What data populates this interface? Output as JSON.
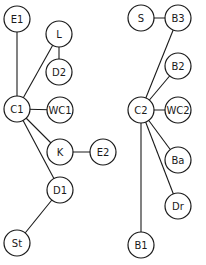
{
  "diagram": {
    "type": "graph",
    "node_radius": 13,
    "nodes": [
      {
        "id": "E1",
        "label": "E1",
        "x": 17,
        "y": 19
      },
      {
        "id": "L",
        "label": "L",
        "x": 59,
        "y": 34
      },
      {
        "id": "D2",
        "label": "D2",
        "x": 59,
        "y": 72
      },
      {
        "id": "C1",
        "label": "C1",
        "x": 17,
        "y": 109
      },
      {
        "id": "WC1",
        "label": "WC1",
        "x": 60,
        "y": 110
      },
      {
        "id": "K",
        "label": "K",
        "x": 60,
        "y": 152
      },
      {
        "id": "E2",
        "label": "E2",
        "x": 103,
        "y": 152
      },
      {
        "id": "D1",
        "label": "D1",
        "x": 60,
        "y": 190
      },
      {
        "id": "St",
        "label": "St",
        "x": 17,
        "y": 243
      },
      {
        "id": "S",
        "label": "S",
        "x": 141,
        "y": 18
      },
      {
        "id": "B3",
        "label": "B3",
        "x": 178,
        "y": 18
      },
      {
        "id": "B2",
        "label": "B2",
        "x": 178,
        "y": 66
      },
      {
        "id": "C2",
        "label": "C2",
        "x": 141,
        "y": 110
      },
      {
        "id": "WC2",
        "label": "WC2",
        "x": 178,
        "y": 110
      },
      {
        "id": "Ba",
        "label": "Ba",
        "x": 178,
        "y": 160
      },
      {
        "id": "Dr",
        "label": "Dr",
        "x": 178,
        "y": 206
      },
      {
        "id": "B1",
        "label": "B1",
        "x": 141,
        "y": 245
      }
    ],
    "edges": [
      [
        "C1",
        "E1"
      ],
      [
        "C1",
        "L"
      ],
      [
        "L",
        "D2"
      ],
      [
        "C1",
        "WC1"
      ],
      [
        "C1",
        "K"
      ],
      [
        "K",
        "E2"
      ],
      [
        "C1",
        "D1"
      ],
      [
        "D1",
        "St"
      ],
      [
        "S",
        "B3"
      ],
      [
        "C2",
        "B3"
      ],
      [
        "C2",
        "B2"
      ],
      [
        "C2",
        "WC2"
      ],
      [
        "C2",
        "Ba"
      ],
      [
        "C2",
        "Dr"
      ],
      [
        "C2",
        "B1"
      ]
    ]
  }
}
